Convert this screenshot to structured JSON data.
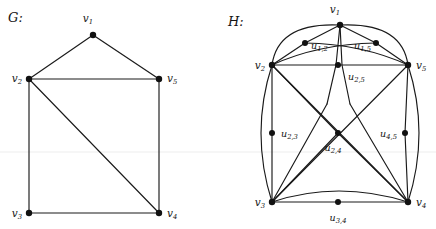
{
  "figure": {
    "background": "#ffffff",
    "ink_color": "#1a1a1a",
    "node_color": "#111111",
    "panels": [
      {
        "id": "G",
        "caption": "G:",
        "caption_x": 8,
        "caption_y": 22
      },
      {
        "id": "H",
        "caption": "H:",
        "caption_x": 228,
        "caption_y": 26
      }
    ],
    "faint_rule_y": 152
  },
  "graph_G": {
    "name": "G",
    "caption": "G:",
    "vertices": [
      {
        "id": "v1",
        "label": "v",
        "sub": "1",
        "x": 93,
        "y": 35,
        "label_x": 88,
        "label_y": 22,
        "label_anchor": "middle"
      },
      {
        "id": "v2",
        "label": "v",
        "sub": "2",
        "x": 29,
        "y": 79,
        "label_x": 22,
        "label_y": 82,
        "label_anchor": "end"
      },
      {
        "id": "v3",
        "label": "v",
        "sub": "3",
        "x": 29,
        "y": 213,
        "label_x": 22,
        "label_y": 217,
        "label_anchor": "end"
      },
      {
        "id": "v4",
        "label": "v",
        "sub": "4",
        "x": 159,
        "y": 213,
        "label_x": 167,
        "label_y": 217,
        "label_anchor": "start"
      },
      {
        "id": "v5",
        "label": "v",
        "sub": "5",
        "x": 159,
        "y": 79,
        "label_x": 167,
        "label_y": 82,
        "label_anchor": "start"
      }
    ],
    "edges": [
      {
        "from": "v1",
        "to": "v2"
      },
      {
        "from": "v1",
        "to": "v5"
      },
      {
        "from": "v2",
        "to": "v5"
      },
      {
        "from": "v2",
        "to": "v3"
      },
      {
        "from": "v2",
        "to": "v4"
      },
      {
        "from": "v3",
        "to": "v4"
      },
      {
        "from": "v4",
        "to": "v5"
      }
    ],
    "edge_count": 7,
    "vertex_count": 5
  },
  "graph_H": {
    "name": "H",
    "caption": "H:",
    "vertices": [
      {
        "id": "v1",
        "label": "v",
        "sub": "1",
        "x": 340,
        "y": 25,
        "label_x": 335,
        "label_y": 13,
        "label_anchor": "middle"
      },
      {
        "id": "v2",
        "label": "v",
        "sub": "2",
        "x": 272,
        "y": 65,
        "label_x": 265,
        "label_y": 69,
        "label_anchor": "end"
      },
      {
        "id": "v3",
        "label": "v",
        "sub": "3",
        "x": 272,
        "y": 202,
        "label_x": 265,
        "label_y": 206,
        "label_anchor": "end"
      },
      {
        "id": "v4",
        "label": "v",
        "sub": "4",
        "x": 408,
        "y": 202,
        "label_x": 416,
        "label_y": 206,
        "label_anchor": "start"
      },
      {
        "id": "v5",
        "label": "v",
        "sub": "5",
        "x": 408,
        "y": 65,
        "label_x": 416,
        "label_y": 69,
        "label_anchor": "start"
      }
    ],
    "subdivision_vertices": [
      {
        "id": "u12",
        "label": "u",
        "sub": "1,2",
        "x": 305,
        "y": 43,
        "label_x": 311,
        "label_y": 49,
        "label_anchor": "start"
      },
      {
        "id": "u15",
        "label": "u",
        "sub": "1,5",
        "x": 376,
        "y": 43,
        "label_x": 371,
        "label_y": 49,
        "label_anchor": "end"
      },
      {
        "id": "u25",
        "label": "u",
        "sub": "2,5",
        "x": 338,
        "y": 65,
        "label_x": 348,
        "label_y": 80,
        "label_anchor": "start"
      },
      {
        "id": "u23",
        "label": "u",
        "sub": "2,3",
        "x": 272,
        "y": 133,
        "label_x": 281,
        "label_y": 137,
        "label_anchor": "start"
      },
      {
        "id": "u24",
        "label": "u",
        "sub": "2,4",
        "x": 338,
        "y": 133,
        "label_x": 333,
        "label_y": 151,
        "label_anchor": "middle"
      },
      {
        "id": "u45",
        "label": "u",
        "sub": "4,5",
        "x": 405,
        "y": 133,
        "label_x": 397,
        "label_y": 137,
        "label_anchor": "end"
      },
      {
        "id": "u34",
        "label": "u",
        "sub": "3,4",
        "x": 338,
        "y": 202,
        "label_x": 338,
        "label_y": 221,
        "label_anchor": "middle"
      }
    ],
    "vertex_count": 12,
    "edges": [
      {
        "from": "v1",
        "to": "u12",
        "kind": "straight"
      },
      {
        "from": "u12",
        "to": "v2",
        "kind": "straight"
      },
      {
        "from": "v1",
        "to": "u15",
        "kind": "straight"
      },
      {
        "from": "u15",
        "to": "v5",
        "kind": "straight"
      },
      {
        "from": "v2",
        "to": "v1",
        "kind": "arc-outer-left"
      },
      {
        "from": "v5",
        "to": "v1",
        "kind": "arc-outer-right"
      },
      {
        "from": "v2",
        "to": "u15",
        "kind": "arc-inner"
      },
      {
        "from": "v5",
        "to": "u12",
        "kind": "arc-inner"
      },
      {
        "from": "v2",
        "to": "u25",
        "kind": "straight"
      },
      {
        "from": "u25",
        "to": "v5",
        "kind": "straight"
      },
      {
        "from": "v1",
        "to": "u25",
        "kind": "straight-pair"
      },
      {
        "from": "v2",
        "to": "u23",
        "kind": "straight"
      },
      {
        "from": "u23",
        "to": "v3",
        "kind": "straight"
      },
      {
        "from": "v2",
        "to": "v3",
        "kind": "arc-outer-left"
      },
      {
        "from": "v5",
        "to": "u45",
        "kind": "straight"
      },
      {
        "from": "u45",
        "to": "v4",
        "kind": "straight"
      },
      {
        "from": "v5",
        "to": "v4",
        "kind": "arc-outer-right"
      },
      {
        "from": "v3",
        "to": "u34",
        "kind": "straight"
      },
      {
        "from": "u34",
        "to": "v4",
        "kind": "straight"
      },
      {
        "from": "v3",
        "to": "v4",
        "kind": "arc-bottom"
      },
      {
        "from": "v2",
        "to": "u24",
        "kind": "straight"
      },
      {
        "from": "u24",
        "to": "v4",
        "kind": "straight"
      },
      {
        "from": "v2",
        "to": "v4",
        "kind": "straight-cross"
      },
      {
        "from": "v5",
        "to": "v3",
        "kind": "straight-cross"
      },
      {
        "from": "v3",
        "to": "u24",
        "kind": "straight"
      },
      {
        "from": "v1",
        "to": "v3",
        "kind": "straight-long"
      },
      {
        "from": "v1",
        "to": "v4",
        "kind": "straight-long"
      }
    ]
  }
}
